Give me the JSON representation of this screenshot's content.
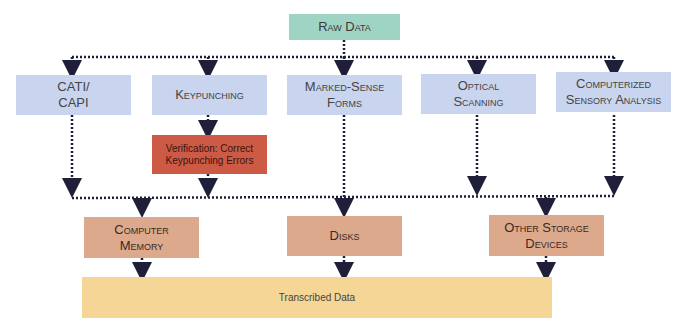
{
  "diagram": {
    "source": {
      "label": "Raw Data"
    },
    "methods": [
      {
        "label": "CATI/\nCAPI"
      },
      {
        "label": "Keypunching"
      },
      {
        "label": "Marked-Sense\nForms"
      },
      {
        "label": "Optical\nScanning"
      },
      {
        "label": "Computerized\nSensory Analysis"
      }
    ],
    "verification": {
      "label": "Verification: Correct\nKeypunching Errors"
    },
    "storage": [
      {
        "label": "Computer\nMemory"
      },
      {
        "label": "Disks"
      },
      {
        "label": "Other Storage\nDevices"
      }
    ],
    "output": {
      "label": "Transcribed Data"
    },
    "colors": {
      "source": "#9fd3c4",
      "methods": "#c9d5ee",
      "verification": "#cc5a45",
      "storage": "#dda98c",
      "output": "#f5d697",
      "connector": "#1f1f3a"
    }
  }
}
